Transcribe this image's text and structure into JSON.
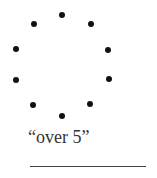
{
  "dots": [
    {
      "x": 62,
      "y": 15
    },
    {
      "x": 34,
      "y": 24
    },
    {
      "x": 91,
      "y": 24
    },
    {
      "x": 16,
      "y": 49
    },
    {
      "x": 108,
      "y": 50
    },
    {
      "x": 16,
      "y": 80
    },
    {
      "x": 109,
      "y": 79
    },
    {
      "x": 33,
      "y": 105
    },
    {
      "x": 90,
      "y": 104
    },
    {
      "x": 62,
      "y": 116
    }
  ],
  "dot_count": 10,
  "label": "“over 5”",
  "answer_blank": ""
}
